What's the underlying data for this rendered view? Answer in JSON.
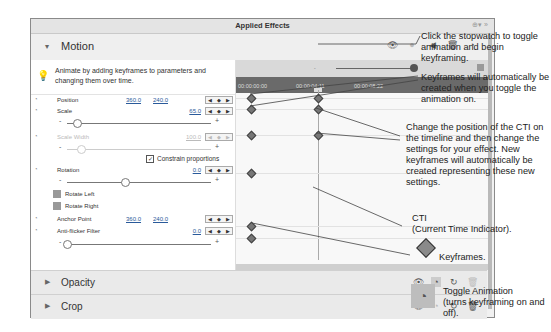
{
  "panel": {
    "title": "Applied Effects",
    "title_icons": [
      "add-effect-icon",
      "panel-menu-icon"
    ],
    "title_icon_glyphs": "⊕▾ »"
  },
  "motion": {
    "label": "Motion",
    "expanded": true,
    "header_icons": [
      "eye-icon",
      "keyframe-dot-icon",
      "speaker-icon",
      "trash-icon",
      "stopwatch-icon"
    ],
    "hint": "Animate by adding keyframes to parameters and changing them over time.",
    "params": [
      {
        "name": "Position",
        "value1": "360.0",
        "value2": "240.0"
      },
      {
        "name": "Scale",
        "value": "65.0"
      },
      {
        "name": "Scale Width",
        "value": "100.0",
        "disabled": true
      },
      {
        "name": "Rotation",
        "value": "0.0"
      },
      {
        "name": "Anchor Point",
        "value1": "360.0",
        "value2": "240.0"
      },
      {
        "name": "Anti-flicker Filter",
        "value": "0.0"
      }
    ],
    "constrain_label": "Constrain proportions",
    "constrain_checked": true,
    "rotate_left": "Rotate Left",
    "rotate_right": "Rotate Right",
    "slider_minus": "-",
    "slider_plus": "+",
    "kf_nav": {
      "prev": "◀",
      "add": "◆",
      "next": "▶"
    }
  },
  "timeline": {
    "ruler": [
      "00:00:00:00",
      "00:00:04:11",
      "00:00:08:22"
    ],
    "zoom_minus": "-"
  },
  "sections": [
    {
      "label": "Opacity",
      "icons": [
        "eye-icon",
        "stopwatch-icon",
        "reset-icon",
        "trash-icon"
      ]
    },
    {
      "label": "Crop",
      "icons": [
        "eye-icon",
        "stopwatch-icon",
        "reset-icon",
        "trash-icon"
      ]
    }
  ],
  "callouts": {
    "stopwatch": "Click the stopwatch to toggle animation and begin keyframing.",
    "auto_keyframes": "Keyframes will automatically be created when you toggle the animation on.",
    "change_cti": "Change the position of the CTI on the timeline and then change the settings for your effect. New keyframes will automatically be created representing these new settings.",
    "cti_title": "CTI",
    "cti_desc": "(Current Time Indicator).",
    "keyframes": "Keyframes.",
    "toggle_title": "Toggle Animation",
    "toggle_desc": "(turns keyframing on and off)."
  }
}
